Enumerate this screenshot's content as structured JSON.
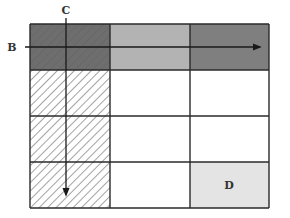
{
  "diagram": {
    "type": "grid-table-with-arrows",
    "rows": 4,
    "cols": 3,
    "labels": {
      "row_arrow": "B",
      "col_arrow": "C",
      "cell_label": "D"
    },
    "cells": [
      {
        "row": 1,
        "col": 1,
        "fill": "#6e6e6e",
        "hatched": true
      },
      {
        "row": 1,
        "col": 2,
        "fill": "#b3b3b3",
        "hatched": false
      },
      {
        "row": 1,
        "col": 3,
        "fill": "#7f7f7f",
        "hatched": false
      },
      {
        "row": 2,
        "col": 1,
        "fill": "#ffffff",
        "hatched": true
      },
      {
        "row": 2,
        "col": 2,
        "fill": "#ffffff",
        "hatched": false
      },
      {
        "row": 2,
        "col": 3,
        "fill": "#ffffff",
        "hatched": false
      },
      {
        "row": 3,
        "col": 1,
        "fill": "#ffffff",
        "hatched": true
      },
      {
        "row": 3,
        "col": 2,
        "fill": "#ffffff",
        "hatched": false
      },
      {
        "row": 3,
        "col": 3,
        "fill": "#ffffff",
        "hatched": false
      },
      {
        "row": 4,
        "col": 1,
        "fill": "#ffffff",
        "hatched": true
      },
      {
        "row": 4,
        "col": 2,
        "fill": "#ffffff",
        "hatched": false
      },
      {
        "row": 4,
        "col": 3,
        "fill": "#e4e4e4",
        "hatched": false,
        "label": "D"
      }
    ],
    "arrows": [
      {
        "name": "B",
        "direction": "right",
        "along": "row 1"
      },
      {
        "name": "C",
        "direction": "down",
        "along": "column 1"
      }
    ],
    "colors": {
      "line": "#2a2a2a",
      "hatch": "#555555"
    }
  }
}
